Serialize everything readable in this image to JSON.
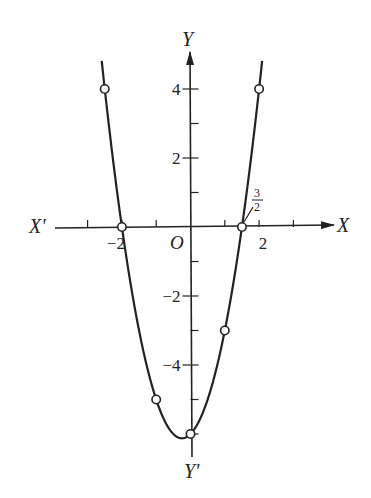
{
  "chart_data": {
    "type": "line",
    "title": "",
    "function": "y = 2x^2 + x - 6",
    "xlabel": "X",
    "xlabel_neg": "X'",
    "ylabel": "Y",
    "ylabel_neg": "Y'",
    "origin_label": "O",
    "xlim": [
      -3.9,
      4.2
    ],
    "ylim": [
      -6.7,
      5.1
    ],
    "x_ticks": [
      -3,
      -2,
      -1,
      1,
      2,
      3
    ],
    "x_tick_labels": [
      {
        "value": -2,
        "text": "−2"
      },
      {
        "value": 2,
        "text": "2"
      }
    ],
    "y_ticks": [
      -6,
      -5,
      -4,
      -3,
      -2,
      -1,
      1,
      2,
      3,
      4
    ],
    "y_tick_labels": [
      {
        "value": 4,
        "text": "4"
      },
      {
        "value": 2,
        "text": "2"
      },
      {
        "value": -2,
        "text": "−2"
      },
      {
        "value": -4,
        "text": "−4"
      }
    ],
    "annotation": {
      "text_num": "3",
      "text_den": "2",
      "x": 1.5,
      "y": 0
    },
    "marked_points": [
      {
        "x": -2.5,
        "y": 4
      },
      {
        "x": -2,
        "y": 0
      },
      {
        "x": -1,
        "y": -5
      },
      {
        "x": 0,
        "y": -6
      },
      {
        "x": 1,
        "y": -3
      },
      {
        "x": 1.5,
        "y": 0
      },
      {
        "x": 2,
        "y": 4
      }
    ],
    "vertex": {
      "x": -0.25,
      "y": -6.125
    },
    "grid": false
  }
}
